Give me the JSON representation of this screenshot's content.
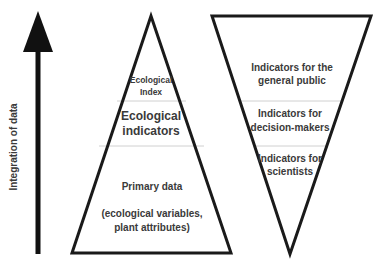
{
  "axis": {
    "label": "Integration of data",
    "direction": "up"
  },
  "pyramid_left": {
    "shape": "upright-triangle",
    "tiers": [
      {
        "lines": [
          "Ecological",
          "Index"
        ]
      },
      {
        "lines": [
          "Ecological",
          "indicators"
        ]
      },
      {
        "lines": [
          "Primary data",
          "",
          "(ecological variables,",
          "plant attributes)"
        ]
      }
    ]
  },
  "pyramid_right": {
    "shape": "inverted-triangle",
    "tiers": [
      {
        "lines": [
          "Indicators for the",
          "general public"
        ]
      },
      {
        "lines": [
          "Indicators for",
          "decision-makers"
        ]
      },
      {
        "lines": [
          "Indicators for",
          "scientists"
        ]
      }
    ]
  },
  "colors": {
    "stroke": "#1a1a1a",
    "divider": "#d0d0d0",
    "text": "#3a3a3a",
    "background": "#ffffff"
  }
}
